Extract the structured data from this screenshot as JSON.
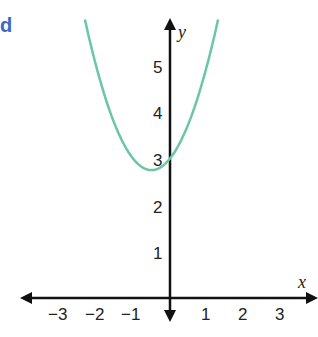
{
  "part_label": "d",
  "chart_data": {
    "type": "line",
    "title": "",
    "function": "y = x^2 + x + 3",
    "xlabel": "x",
    "ylabel": "y",
    "x_ticks": [
      "-3",
      "-2",
      "-1",
      "1",
      "2",
      "3"
    ],
    "y_ticks": [
      "1",
      "2",
      "3",
      "4",
      "5"
    ],
    "xlim": [
      -4,
      4
    ],
    "ylim": [
      0,
      6
    ],
    "grid": false,
    "series": [
      {
        "name": "parabola",
        "color": "#6cc6a6",
        "vertex": [
          -0.5,
          2.75
        ],
        "y_intercept": 3,
        "points": [
          [
            -2.3,
            6.0
          ],
          [
            -2,
            5
          ],
          [
            -1.5,
            3.75
          ],
          [
            -1,
            3
          ],
          [
            -0.5,
            2.75
          ],
          [
            0,
            3
          ],
          [
            0.5,
            3.75
          ],
          [
            1,
            5
          ],
          [
            1.3,
            6.0
          ]
        ]
      }
    ]
  }
}
